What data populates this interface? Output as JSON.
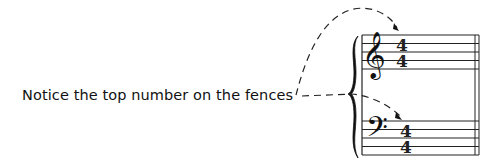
{
  "caption": {
    "text": "Notice the top number on the fences"
  },
  "music": {
    "treble_clef": "𝄞",
    "bass_clef": "𝄢",
    "treble_time_signature": {
      "top": "4",
      "bottom": "4"
    },
    "bass_time_signature": {
      "top": "4",
      "bottom": "4"
    },
    "icons": {
      "treble": "treble-clef-icon",
      "bass": "bass-clef-icon",
      "brace": "brace-icon",
      "arrow": "dashed-arrow-icon"
    }
  },
  "colors": {
    "ink": "#111111",
    "background": "#ffffff"
  }
}
